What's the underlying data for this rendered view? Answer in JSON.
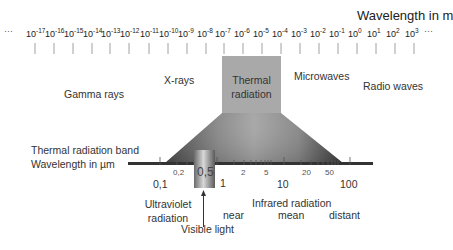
{
  "axis_title": "Wavelength in m",
  "wavelength_ticks": [
    {
      "base": "10",
      "exp": "-17"
    },
    {
      "base": "10",
      "exp": "-16"
    },
    {
      "base": "10",
      "exp": "-15"
    },
    {
      "base": "10",
      "exp": "-14"
    },
    {
      "base": "10",
      "exp": "-13"
    },
    {
      "base": "10",
      "exp": "-12"
    },
    {
      "base": "10",
      "exp": "-11"
    },
    {
      "base": "10",
      "exp": "-10"
    },
    {
      "base": "10",
      "exp": "-9"
    },
    {
      "base": "10",
      "exp": "-8"
    },
    {
      "base": "10",
      "exp": "-7"
    },
    {
      "base": "10",
      "exp": "-6"
    },
    {
      "base": "10",
      "exp": "-5"
    },
    {
      "base": "10",
      "exp": "-4"
    },
    {
      "base": "10",
      "exp": "-3"
    },
    {
      "base": "10",
      "exp": "-2"
    },
    {
      "base": "10",
      "exp": "-1"
    },
    {
      "base": "10",
      "exp": "0"
    },
    {
      "base": "10",
      "exp": "1"
    },
    {
      "base": "10",
      "exp": "2"
    },
    {
      "base": "10",
      "exp": "3"
    }
  ],
  "ellipsis_left": "···",
  "ellipsis_right": "···",
  "regions": {
    "gamma": "Gamma rays",
    "xrays": "X-rays",
    "thermal_line1": "Thermal",
    "thermal_line2": "radiation",
    "microwaves": "Microwaves",
    "radio": "Radio waves"
  },
  "band": {
    "title_line1": "Thermal radiation band",
    "title_line2": "Wavelength in µm",
    "major_labels": [
      "0,1",
      "1",
      "10",
      "100"
    ],
    "minor_labels": [
      "0,2",
      "0,5",
      "2",
      "5",
      "20",
      "50"
    ]
  },
  "annotations": {
    "uv_line1": "Ultraviolet",
    "uv_line2": "radiation",
    "visible": "Visible light",
    "infrared": "Infrared radiation",
    "near": "near",
    "mean": "mean",
    "distant": "distant"
  },
  "colors": {
    "thermal_box": "#a9a9a9",
    "gradient_light": "#b5b5b5",
    "gradient_dark": "#3c3c3c",
    "baseline": "#333333",
    "text": "#333333"
  }
}
